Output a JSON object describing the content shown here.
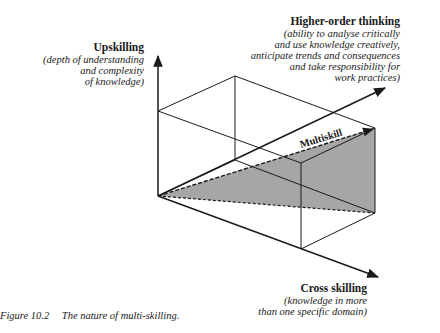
{
  "axes": {
    "upskilling": {
      "title": "Upskilling",
      "desc_lines": [
        "(depth of understanding",
        "and complexity",
        "of knowledge)"
      ]
    },
    "higher_order": {
      "title": "Higher-order thinking",
      "desc_lines": [
        "(ability to analyse critically",
        "and use knowledge creatively,",
        "anticipate trends and consequences",
        "and take responsibility for",
        "work practices)"
      ]
    },
    "cross_skilling": {
      "title": "Cross skilling",
      "desc_lines": [
        "(knowledge in more",
        "than one specific domain)"
      ]
    }
  },
  "vector_label": "Multiskill",
  "caption": {
    "number": "Figure 10.2",
    "text": "The nature of multi-skilling."
  },
  "colors": {
    "line": "#1a1a1a",
    "shade": "#9a9a9a"
  }
}
